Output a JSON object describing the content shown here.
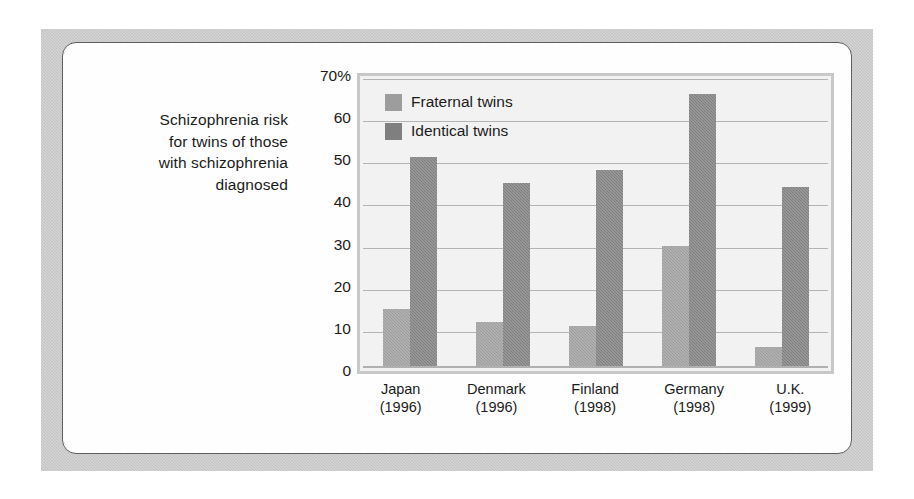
{
  "caption": {
    "lines": [
      "Schizophrenia risk",
      "for twins of those",
      "with schizophrenia",
      "diagnosed"
    ]
  },
  "colors": {
    "fraternal": "#9d9d9d",
    "identical": "#7f7f7f",
    "plot_background": "#f2f2f2",
    "frame": "#c3c3c3",
    "panel": "#fefefe",
    "gridline": "#b4b4b4",
    "text": "#1b1b1b"
  },
  "chart_data": {
    "type": "bar",
    "title": "Schizophrenia risk for twins of those with schizophrenia diagnosed",
    "xlabel": "",
    "ylabel": "",
    "ylim": [
      0,
      70
    ],
    "yticks": [
      0,
      10,
      20,
      30,
      40,
      50,
      60,
      70
    ],
    "ytick_labels": [
      "0",
      "10",
      "20",
      "30",
      "40",
      "50",
      "60",
      "70%"
    ],
    "grid": true,
    "legend_position": "top-left",
    "categories": [
      "Japan",
      "Denmark",
      "Finland",
      "Germany",
      "U.K."
    ],
    "category_years": [
      "(1996)",
      "(1996)",
      "(1998)",
      "(1998)",
      "(1999)"
    ],
    "series": [
      {
        "name": "Fraternal twins",
        "values": [
          14,
          11,
          10,
          29,
          5
        ]
      },
      {
        "name": "Identical twins",
        "values": [
          50,
          44,
          47,
          65,
          43
        ]
      }
    ]
  }
}
